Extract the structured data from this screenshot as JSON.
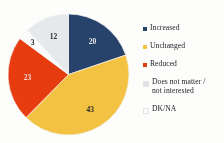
{
  "chart_data": {
    "type": "pie",
    "title": "",
    "subtitle": "",
    "xlabel": "",
    "ylabel": "",
    "grid": false,
    "legend_position": "right",
    "value_suffix": "",
    "total": 101,
    "categories": [
      "Increased",
      "Unchanged",
      "Reduced",
      "Does not matter /\nnot interested",
      "DK/NA"
    ],
    "values": [
      20,
      43,
      23,
      3,
      12
    ],
    "data_labels": [
      "20",
      "43",
      "23",
      "3",
      "12"
    ],
    "colors": [
      "#27426b",
      "#f3c243",
      "#e63c10",
      "#fbfbfb",
      "#e6e9ec"
    ],
    "slices": [
      {
        "label": "Increased",
        "value": 20,
        "data_label": "20",
        "color": "#27426b",
        "label_color": "on-dark"
      },
      {
        "label": "Unchanged",
        "value": 43,
        "data_label": "43",
        "color": "#f3c243",
        "label_color": "on-light"
      },
      {
        "label": "Reduced",
        "value": 23,
        "data_label": "23",
        "color": "#e63c10",
        "label_color": "on-red"
      },
      {
        "label": "Does not matter /\nnot interested",
        "value": 3,
        "data_label": "3",
        "color": "#fbfbfb",
        "label_color": "on-light"
      },
      {
        "label": "DK/NA",
        "value": 12,
        "data_label": "12",
        "color": "#e6e9ec",
        "label_color": "on-light"
      }
    ]
  },
  "legend": {
    "items": [
      {
        "label": "Increased",
        "color": "#27426b"
      },
      {
        "label": "Unchanged",
        "color": "#f3c243"
      },
      {
        "label": "Reduced",
        "color": "#e63c10"
      },
      {
        "label": "Does not matter /\nnot interested",
        "color": "#dfe3e7"
      },
      {
        "label": "DK/NA",
        "color": "#fcfcfc"
      }
    ]
  }
}
